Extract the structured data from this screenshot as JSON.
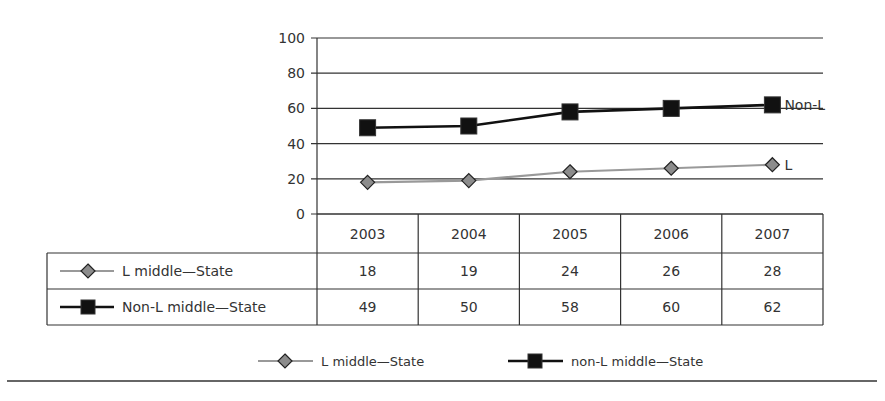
{
  "chart_data": {
    "type": "line",
    "title": "",
    "xlabel": "",
    "ylabel": "",
    "categories": [
      "2003",
      "2004",
      "2005",
      "2006",
      "2007"
    ],
    "ylim": [
      0,
      100
    ],
    "yticks": [
      0,
      20,
      40,
      60,
      80,
      100
    ],
    "grid": true,
    "series": [
      {
        "name": "L middle—State",
        "legend_name": "L middle—State",
        "end_label": "L",
        "values": [
          18,
          19,
          24,
          26,
          28
        ],
        "color": "#999999",
        "marker": "diamond",
        "marker_fill": "#8c8c8c"
      },
      {
        "name": "Non-L middle—State",
        "legend_name": "non-L middle—State",
        "end_label": "Non-L",
        "values": [
          49,
          50,
          58,
          60,
          62
        ],
        "color": "#111111",
        "marker": "square",
        "marker_fill": "#111111"
      }
    ],
    "data_table": true,
    "legend_position": "bottom"
  },
  "colors": {
    "grid": "#333333",
    "text": "#333333",
    "rule": "#333333"
  }
}
